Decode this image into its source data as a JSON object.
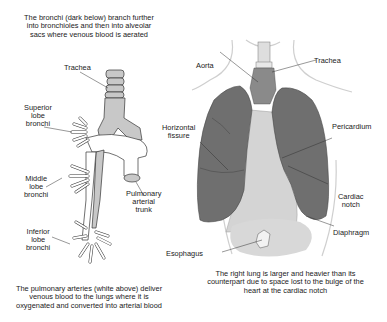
{
  "captions": {
    "top_left": "The bronchi (dark below) branch further into bronchioles and then into alveolar sacs where venous blood is aerated",
    "bottom_left": "The pulmonary arteries (white above) deliver venous blood to the lungs where it is oxygenated and converted into arterial blood",
    "bottom_right": "The right lung is larger and heavier than its counterpart due to space lost to the bulge of the heart at the cardiac notch"
  },
  "left_diagram": {
    "labels": {
      "trachea": "Trachea",
      "superior_1": "Superior",
      "superior_2": "lobe",
      "superior_3": "bronchi",
      "middle_1": "Middle",
      "middle_2": "lobe",
      "middle_3": "bronchi",
      "inferior_1": "Inferior",
      "inferior_2": "lobe",
      "inferior_3": "bronchi",
      "pulm_1": "Pulmonary",
      "pulm_2": "arterial",
      "pulm_3": "trunk"
    }
  },
  "right_diagram": {
    "labels": {
      "aorta": "Aorta",
      "trachea": "Trachea",
      "horiz_1": "Horizontal",
      "horiz_2": "fissure",
      "pericardium": "Pericardium",
      "cardiac_1": "Cardiac",
      "cardiac_2": "notch",
      "diaphragm": "Diaphragm",
      "esophagus": "Esophagus"
    }
  },
  "colors": {
    "lung": "#6f6f6f",
    "bronchi": "#c8c8c8",
    "heart": "#d4d4d4",
    "line": "#333333"
  }
}
